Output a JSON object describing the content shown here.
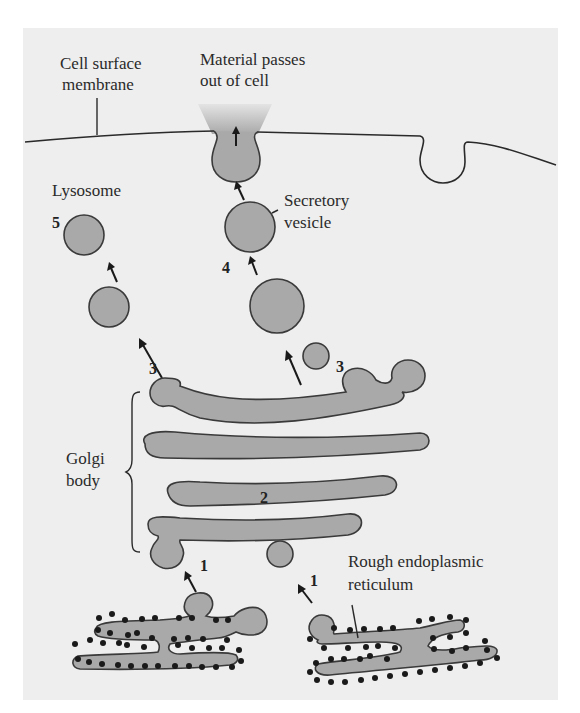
{
  "diagram": {
    "labels": {
      "membrane_line1": "Cell surface",
      "membrane_line2": "membrane",
      "exit_line1": "Material passes",
      "exit_line2": "out of cell",
      "lysosome": "Lysosome",
      "secretory_line1": "Secretory",
      "secretory_line2": "vesicle",
      "golgi_line1": "Golgi",
      "golgi_line2": "body",
      "rer_line1": "Rough endoplasmic",
      "rer_line2": "reticulum"
    },
    "steps": {
      "step1_left": "1",
      "step1_right": "1",
      "step2": "2",
      "step3_left": "3",
      "step3_right": "3",
      "step4": "4",
      "step5": "5"
    },
    "colors": {
      "background": "#eeeeee",
      "organelle_fill": "#a9a9a9",
      "outline": "#3a3a3a",
      "ribosome": "#1a1a1a"
    }
  }
}
